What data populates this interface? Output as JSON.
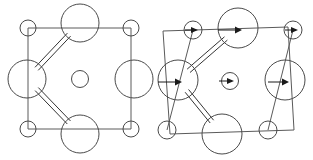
{
  "figure": {
    "title": "Crystal structure unit cells: undistorted and distorted",
    "type": "crystal-structure-diagram",
    "canvas": {
      "width": 313,
      "height": 160,
      "background": "#ffffff"
    },
    "colors": {
      "cell_edge": "#5a5a5a",
      "atom_outline": "#4a4a4a",
      "bond": "#333333",
      "vector": "#1a1a1a",
      "background": "#ffffff"
    },
    "panels": [
      {
        "id": "left-panel",
        "name": "undistorted-unit-cell",
        "label": "",
        "cell_shape": "square",
        "cell_corners": [
          [
            28,
            28
          ],
          [
            131,
            28
          ],
          [
            131,
            129
          ],
          [
            28,
            129
          ]
        ],
        "has_displacement_vectors": false,
        "atoms": [
          {
            "name": "corner-atom-top-left",
            "cx": 28,
            "cy": 28,
            "r": 8,
            "size": "small",
            "vector": null
          },
          {
            "name": "corner-atom-top-right",
            "cx": 131,
            "cy": 28,
            "r": 8,
            "size": "small",
            "vector": null
          },
          {
            "name": "corner-atom-bottom-left",
            "cx": 28,
            "cy": 129,
            "r": 8,
            "size": "small",
            "vector": null
          },
          {
            "name": "corner-atom-bottom-right",
            "cx": 131,
            "cy": 129,
            "r": 8,
            "size": "small",
            "vector": null
          },
          {
            "name": "edge-atom-top",
            "cx": 80,
            "cy": 23,
            "r": 19,
            "size": "large",
            "vector": null
          },
          {
            "name": "edge-atom-left",
            "cx": 27,
            "cy": 79,
            "r": 19,
            "size": "large",
            "vector": null
          },
          {
            "name": "edge-atom-bottom",
            "cx": 80,
            "cy": 134,
            "r": 19,
            "size": "large",
            "vector": null
          },
          {
            "name": "edge-atom-right",
            "cx": 134,
            "cy": 79,
            "r": 19,
            "size": "large",
            "vector": null
          },
          {
            "name": "center-atom",
            "cx": 80,
            "cy": 79,
            "r": 8.5,
            "size": "medium",
            "vector": null
          }
        ],
        "bonds": [
          {
            "name": "bond-left-to-top",
            "x1": 27,
            "y1": 79,
            "x2": 80,
            "y2": 23,
            "style": "double"
          },
          {
            "name": "bond-left-to-bottom",
            "x1": 27,
            "y1": 79,
            "x2": 80,
            "y2": 134,
            "style": "double"
          }
        ]
      },
      {
        "id": "right-panel",
        "name": "distorted-unit-cell",
        "label": "",
        "cell_shape": "sheared-parallelogram",
        "cell_corners": [
          [
            163,
            31
          ],
          [
            288,
            27
          ],
          [
            294,
            130
          ],
          [
            170,
            134
          ]
        ],
        "has_displacement_vectors": true,
        "atoms": [
          {
            "name": "corner-atom-top-left",
            "cx": 193,
            "cy": 30,
            "r": 9,
            "size": "small",
            "vector": {
              "dx": 11,
              "dy": 0,
              "direction": "right"
            }
          },
          {
            "name": "corner-atom-top-right",
            "cx": 293,
            "cy": 30,
            "r": 9,
            "size": "small",
            "vector": {
              "dx": 11,
              "dy": 0,
              "direction": "right"
            }
          },
          {
            "name": "corner-atom-bottom-left",
            "cx": 167,
            "cy": 130,
            "r": 9,
            "size": "small",
            "vector": null
          },
          {
            "name": "corner-atom-bottom-right",
            "cx": 268,
            "cy": 130,
            "r": 9,
            "size": "small",
            "vector": null
          },
          {
            "name": "edge-atom-top",
            "cx": 238,
            "cy": 28,
            "r": 20,
            "size": "large",
            "vector": {
              "dx": 22,
              "dy": 0,
              "direction": "right"
            }
          },
          {
            "name": "edge-atom-left",
            "cx": 178,
            "cy": 80,
            "r": 20,
            "size": "large",
            "vector": {
              "dx": 22,
              "dy": 0,
              "direction": "right"
            }
          },
          {
            "name": "edge-atom-bottom",
            "cx": 222,
            "cy": 134,
            "r": 20,
            "size": "large",
            "vector": null
          },
          {
            "name": "edge-atom-right",
            "cx": 285,
            "cy": 80,
            "r": 20,
            "size": "large",
            "vector": {
              "dx": 19,
              "dy": 0,
              "direction": "right"
            }
          },
          {
            "name": "center-atom",
            "cx": 230,
            "cy": 81,
            "r": 8.5,
            "size": "medium",
            "vector": {
              "dx": 13,
              "dy": 0,
              "direction": "right"
            }
          }
        ],
        "bonds": [
          {
            "name": "bond-left-to-top",
            "x1": 178,
            "y1": 80,
            "x2": 238,
            "y2": 28,
            "style": "double"
          },
          {
            "name": "bond-left-to-bottom",
            "x1": 178,
            "y1": 80,
            "x2": 222,
            "y2": 134,
            "style": "double"
          }
        ]
      }
    ],
    "legend": {
      "visible": false,
      "entries": []
    },
    "annotations": []
  }
}
